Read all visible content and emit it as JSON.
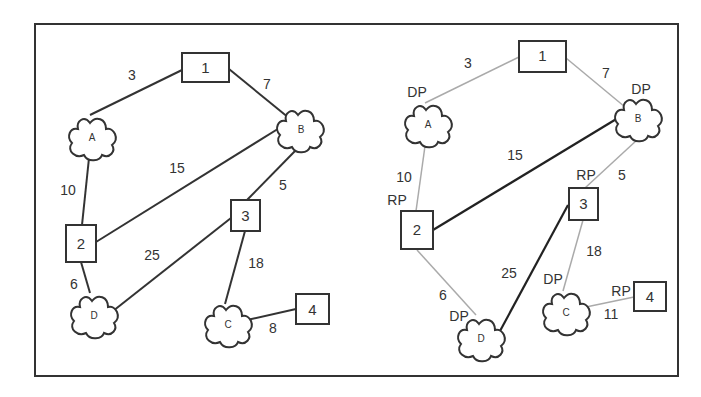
{
  "left_panel": {
    "nodes": {
      "n1": {
        "label": "1",
        "type": "switch"
      },
      "n2": {
        "label": "2",
        "type": "switch"
      },
      "n3": {
        "label": "3",
        "type": "switch"
      },
      "n4": {
        "label": "4",
        "type": "switch"
      },
      "A": {
        "label": "A",
        "type": "network"
      },
      "B": {
        "label": "B",
        "type": "network"
      },
      "C": {
        "label": "C",
        "type": "network"
      },
      "D": {
        "label": "D",
        "type": "network"
      }
    },
    "edges": [
      {
        "from": "n1",
        "to": "A",
        "cost": "3"
      },
      {
        "from": "n1",
        "to": "B",
        "cost": "7"
      },
      {
        "from": "A",
        "to": "n2",
        "cost": "10"
      },
      {
        "from": "n2",
        "to": "B",
        "cost": "15"
      },
      {
        "from": "B",
        "to": "n3",
        "cost": "5"
      },
      {
        "from": "n2",
        "to": "D",
        "cost": "6"
      },
      {
        "from": "D",
        "to": "n3",
        "cost": "25"
      },
      {
        "from": "n3",
        "to": "C",
        "cost": "18"
      },
      {
        "from": "C",
        "to": "n4",
        "cost": "8"
      }
    ]
  },
  "right_panel": {
    "nodes": {
      "n1": {
        "label": "1"
      },
      "n2": {
        "label": "2"
      },
      "n3": {
        "label": "3"
      },
      "n4": {
        "label": "4"
      },
      "A": {
        "label": "A"
      },
      "B": {
        "label": "B"
      },
      "C": {
        "label": "C"
      },
      "D": {
        "label": "D"
      }
    },
    "edges": [
      {
        "from": "n1",
        "to": "A",
        "cost": "3",
        "active": false
      },
      {
        "from": "n1",
        "to": "B",
        "cost": "7",
        "active": false
      },
      {
        "from": "A",
        "to": "n2",
        "cost": "10",
        "active": false
      },
      {
        "from": "n2",
        "to": "B",
        "cost": "15",
        "active": true
      },
      {
        "from": "B",
        "to": "n3",
        "cost": "5",
        "active": false
      },
      {
        "from": "n2",
        "to": "D",
        "cost": "6",
        "active": false
      },
      {
        "from": "D",
        "to": "n3",
        "cost": "25",
        "active": true
      },
      {
        "from": "n3",
        "to": "C",
        "cost": "18",
        "active": false
      },
      {
        "from": "C",
        "to": "n4",
        "cost": "11",
        "active": false
      }
    ],
    "port_labels": {
      "A_dp": "DP",
      "B_dp": "DP",
      "n2_rp": "RP",
      "n3_rp": "RP",
      "C_dp": "DP",
      "D_dp": "DP",
      "n4_rp": "RP"
    }
  },
  "colors": {
    "active_link": "#222222",
    "inactive_link": "#aaaaaa",
    "frame": "#333333"
  }
}
